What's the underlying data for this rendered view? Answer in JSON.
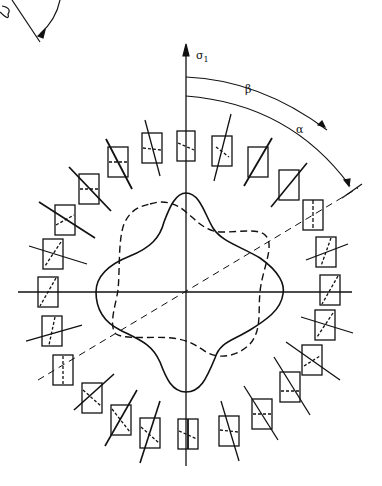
{
  "diagram": {
    "type": "polar stress orientation diagram",
    "axis_label": "σ1",
    "axis_label_main": "σ",
    "axis_label_sub": "1",
    "angle_labels": {
      "beta": "β",
      "alpha": "α"
    },
    "curves": [
      {
        "name": "solid four-lobed curve",
        "style": "solid"
      },
      {
        "name": "dashed rotated four-lobed curve",
        "style": "dashed"
      }
    ],
    "ring_element_count": 24,
    "colors": {
      "ink": "#111111",
      "background": "#ffffff"
    }
  }
}
